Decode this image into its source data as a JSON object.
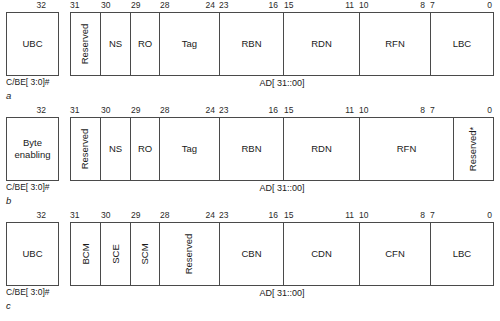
{
  "figure": {
    "type": "pci-bus-field-layout-diagram",
    "bus_width_note": "32",
    "cbe_caption": "C/BE[ 3:0]#",
    "ad_caption": "AD[ 31::00]"
  },
  "rows": [
    {
      "letter": "a",
      "cbe": {
        "label": "UBC",
        "top_tick": "32"
      },
      "ticks": [
        {
          "text": "31",
          "x": 70,
          "align": "left"
        },
        {
          "text": "30",
          "x": 101,
          "align": "left"
        },
        {
          "text": "29",
          "x": 131,
          "align": "left"
        },
        {
          "text": "28",
          "x": 160,
          "align": "left"
        },
        {
          "text": "24",
          "x": 215,
          "align": "right"
        },
        {
          "text": "23",
          "x": 219,
          "align": "left"
        },
        {
          "text": "16",
          "x": 278,
          "align": "right"
        },
        {
          "text": "15",
          "x": 284,
          "align": "left"
        },
        {
          "text": "11",
          "x": 354,
          "align": "right"
        },
        {
          "text": "10",
          "x": 359,
          "align": "left"
        },
        {
          "text": "8",
          "x": 425,
          "align": "right"
        },
        {
          "text": "7",
          "x": 430,
          "align": "left"
        },
        {
          "text": "0",
          "x": 492,
          "align": "right"
        }
      ],
      "fields": [
        {
          "label": "Reserved",
          "left": 0,
          "width": 30,
          "vertical": true
        },
        {
          "label": "NS",
          "left": 30,
          "width": 30,
          "vertical": false
        },
        {
          "label": "RO",
          "left": 60,
          "width": 29,
          "vertical": false
        },
        {
          "label": "Tag",
          "left": 89,
          "width": 60,
          "vertical": false
        },
        {
          "label": "RBN",
          "left": 149,
          "width": 64,
          "vertical": false
        },
        {
          "label": "RDN",
          "left": 213,
          "width": 76,
          "vertical": false
        },
        {
          "label": "RFN",
          "left": 289,
          "width": 71,
          "vertical": false
        },
        {
          "label": "LBC",
          "left": 360,
          "width": 62,
          "vertical": false
        }
      ]
    },
    {
      "letter": "b",
      "cbe": {
        "label": "Byte\nenabling",
        "top_tick": "32"
      },
      "ticks": [
        {
          "text": "31",
          "x": 70,
          "align": "left"
        },
        {
          "text": "30",
          "x": 101,
          "align": "left"
        },
        {
          "text": "29",
          "x": 131,
          "align": "left"
        },
        {
          "text": "28",
          "x": 160,
          "align": "left"
        },
        {
          "text": "24",
          "x": 215,
          "align": "right"
        },
        {
          "text": "23",
          "x": 219,
          "align": "left"
        },
        {
          "text": "16",
          "x": 278,
          "align": "right"
        },
        {
          "text": "15",
          "x": 284,
          "align": "left"
        },
        {
          "text": "11",
          "x": 354,
          "align": "right"
        },
        {
          "text": "10",
          "x": 359,
          "align": "left"
        },
        {
          "text": "8",
          "x": 425,
          "align": "right"
        },
        {
          "text": "7",
          "x": 430,
          "align": "left"
        },
        {
          "text": "0",
          "x": 492,
          "align": "right"
        }
      ],
      "fields": [
        {
          "label": "Reserved",
          "left": 0,
          "width": 30,
          "vertical": true
        },
        {
          "label": "NS",
          "left": 30,
          "width": 30,
          "vertical": false
        },
        {
          "label": "RO",
          "left": 60,
          "width": 29,
          "vertical": false
        },
        {
          "label": "Tag",
          "left": 89,
          "width": 60,
          "vertical": false
        },
        {
          "label": "RBN",
          "left": 149,
          "width": 64,
          "vertical": false
        },
        {
          "label": "RDN",
          "left": 213,
          "width": 76,
          "vertical": false
        },
        {
          "label": "RFN",
          "left": 289,
          "width": 94,
          "vertical": false
        },
        {
          "label": "Reserved*",
          "left": 383,
          "width": 39,
          "vertical": true
        }
      ]
    },
    {
      "letter": "c",
      "cbe": {
        "label": "UBC",
        "top_tick": "32"
      },
      "ticks": [
        {
          "text": "31",
          "x": 70,
          "align": "left"
        },
        {
          "text": "30",
          "x": 101,
          "align": "left"
        },
        {
          "text": "29",
          "x": 131,
          "align": "left"
        },
        {
          "text": "28",
          "x": 160,
          "align": "left"
        },
        {
          "text": "24",
          "x": 215,
          "align": "right"
        },
        {
          "text": "23",
          "x": 219,
          "align": "left"
        },
        {
          "text": "16",
          "x": 278,
          "align": "right"
        },
        {
          "text": "15",
          "x": 284,
          "align": "left"
        },
        {
          "text": "11",
          "x": 354,
          "align": "right"
        },
        {
          "text": "10",
          "x": 359,
          "align": "left"
        },
        {
          "text": "8",
          "x": 425,
          "align": "right"
        },
        {
          "text": "7",
          "x": 430,
          "align": "left"
        },
        {
          "text": "0",
          "x": 492,
          "align": "right"
        }
      ],
      "fields": [
        {
          "label": "BCM",
          "left": 0,
          "width": 30,
          "vertical": true
        },
        {
          "label": "SCE",
          "left": 30,
          "width": 30,
          "vertical": true
        },
        {
          "label": "SCM",
          "left": 60,
          "width": 29,
          "vertical": true
        },
        {
          "label": "Reserved",
          "left": 89,
          "width": 60,
          "vertical": true
        },
        {
          "label": "CBN",
          "left": 149,
          "width": 64,
          "vertical": false
        },
        {
          "label": "CDN",
          "left": 213,
          "width": 76,
          "vertical": false
        },
        {
          "label": "CFN",
          "left": 289,
          "width": 71,
          "vertical": false
        },
        {
          "label": "LBC",
          "left": 360,
          "width": 62,
          "vertical": false
        }
      ]
    }
  ]
}
